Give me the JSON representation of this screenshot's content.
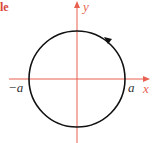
{
  "heading": {
    "text": "le"
  },
  "diagram": {
    "type": "circle-parametrization",
    "axis_color": "#e8604f",
    "curve_color": "#111111",
    "axis_label_color": "#e8604f",
    "labels": {
      "x_axis": "x",
      "y_axis": "y",
      "right_intercept": "a",
      "left_intercept": "−a"
    },
    "orientation": "counterclockwise"
  }
}
